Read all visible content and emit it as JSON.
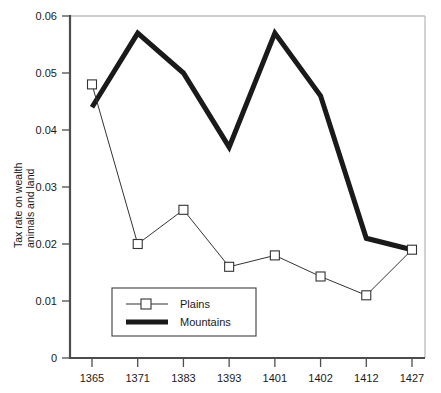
{
  "chart_data": {
    "type": "line",
    "title": "",
    "xlabel": "",
    "ylabel": "Tax rate on wealth\nanimals and land",
    "ylabel_line1": "Tax rate on wealth",
    "ylabel_line2": "animals and land",
    "categories": [
      "1365",
      "1371",
      "1383",
      "1393",
      "1401",
      "1402",
      "1412",
      "1427"
    ],
    "x_tick_labels": [
      "1365",
      "1371",
      "1383",
      "1393",
      "1401",
      "1402",
      "1412",
      "1427"
    ],
    "y_tick_labels": [
      "0",
      "0.01",
      "0.02",
      "0.03",
      "0.04",
      "0.05",
      "0.06"
    ],
    "y_tick_values": [
      0,
      0.01,
      0.02,
      0.03,
      0.04,
      0.05,
      0.06
    ],
    "ylim": [
      0,
      0.06
    ],
    "grid": false,
    "legend_position": "inside-bottom-left",
    "series": [
      {
        "name": "Plains",
        "marker": "open-square",
        "line_width": 1,
        "color": "#333333",
        "values": [
          0.048,
          0.02,
          0.026,
          0.016,
          0.018,
          0.0143,
          0.011,
          0.019
        ]
      },
      {
        "name": "Mountains",
        "marker": "none",
        "line_width": 5,
        "color": "#1a1a1a",
        "values": [
          0.044,
          0.057,
          0.05,
          0.037,
          0.057,
          0.046,
          0.021,
          0.019
        ]
      }
    ]
  },
  "legend": {
    "items": [
      {
        "label": "Plains",
        "style": "thin-line-square-marker"
      },
      {
        "label": "Mountains",
        "style": "thick-line"
      }
    ]
  },
  "colors": {
    "plains": "#333333",
    "mountains": "#1a1a1a",
    "axis": "#555555",
    "frame": "#bbbbbb",
    "text": "#1a1a1a",
    "background": "#ffffff"
  }
}
